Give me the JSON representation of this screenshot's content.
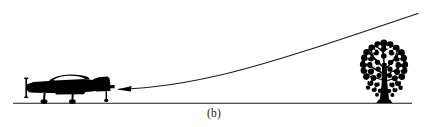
{
  "figure": {
    "caption": "(b)",
    "background_color": "#ffffff",
    "ink_color": "#000000",
    "line_color": "#1a1a1a",
    "width": 428,
    "height": 127,
    "elements": {
      "aircraft": {
        "label": "propeller aircraft silhouette",
        "facing": "left",
        "state": "on ground",
        "x": 24,
        "y": 76,
        "width": 92,
        "height": 28
      },
      "tree": {
        "label": "deciduous tree silhouette",
        "x": 360,
        "y": 38,
        "width": 48,
        "height": 66
      },
      "ground_line": {
        "label": "ground reference line",
        "x1": 13,
        "y1": 103,
        "x2": 412,
        "y2": 103
      },
      "trajectory": {
        "label": "climb-out flight path curve",
        "direction": "toward aircraft",
        "start_x": 418,
        "start_y": 13,
        "end_x": 118,
        "end_y": 89
      },
      "arrowhead": {
        "label": "direction arrowhead",
        "points": "left",
        "tip_x": 118,
        "tip_y": 89
      }
    }
  }
}
